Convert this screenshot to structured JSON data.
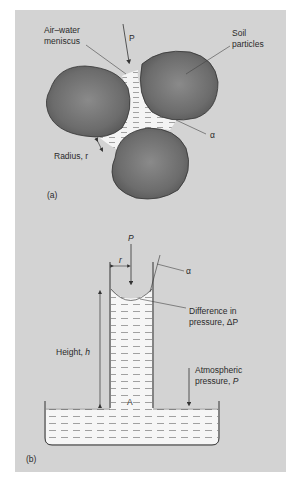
{
  "figure": {
    "panel_background": "#d3d3d3",
    "particle_color": "#6f6f6f",
    "water_color": "#f4f4f4",
    "panel_a": {
      "label": "(a)",
      "meniscus_label_line1": "Air–water",
      "meniscus_label_line2": "meniscus",
      "force_label": "P",
      "particles_label_line1": "Soil",
      "particles_label_line2": "particles",
      "radius_label": "Radius, r",
      "angle_label": "α"
    },
    "panel_b": {
      "label": "(b)",
      "force_label": "P",
      "radius_label": "r",
      "angle_label": "α",
      "pressure_diff_line1": "Difference in",
      "pressure_diff_line2": "pressure, ΔP",
      "height_label_text": "Height, ",
      "height_label_var": "h",
      "atm_line1": "Atmospheric",
      "atm_line2_text": "pressure, ",
      "atm_line2_var": "P",
      "point_label": "A"
    }
  }
}
